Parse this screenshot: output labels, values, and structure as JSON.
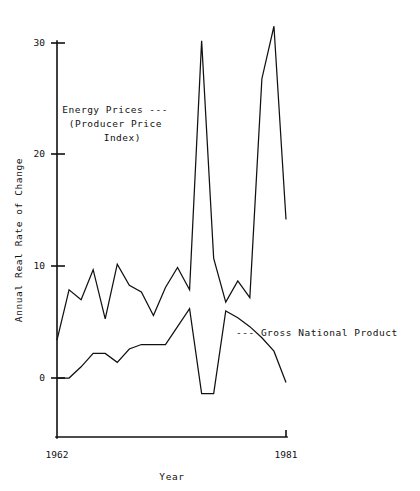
{
  "chart_data": {
    "type": "line",
    "title": "",
    "xlabel": "Year",
    "ylabel": "Annual Real Rate of Change",
    "xlim": [
      1962,
      1981
    ],
    "ylim": [
      -3,
      32
    ],
    "xticks": [
      1962,
      1981
    ],
    "xticklabels": [
      "1962",
      "1981"
    ],
    "yticks": [
      0,
      10,
      20,
      30
    ],
    "yticklabels": [
      "0",
      "10",
      "20",
      "30"
    ],
    "grid": false,
    "legend_position": "inline-annotations",
    "x": [
      1962,
      1963,
      1964,
      1965,
      1966,
      1967,
      1968,
      1969,
      1970,
      1971,
      1972,
      1973,
      1974,
      1975,
      1976,
      1977,
      1978,
      1979,
      1980,
      1981
    ],
    "series": [
      {
        "name": "Energy Prices (Producer Price Index)",
        "values": [
          3.4,
          7.9,
          7.0,
          9.7,
          5.3,
          10.2,
          8.3,
          7.7,
          5.6,
          8.1,
          9.9,
          7.9,
          30.2,
          10.7,
          6.8,
          8.7,
          7.2,
          26.8,
          31.5,
          14.2
        ]
      },
      {
        "name": "Gross National Product",
        "values": [
          0.0,
          0.0,
          1.0,
          2.2,
          2.2,
          1.4,
          2.6,
          3.0,
          3.0,
          3.0,
          4.6,
          6.2,
          -1.4,
          -1.4,
          6.0,
          5.4,
          4.6,
          3.6,
          2.4,
          -0.4
        ]
      }
    ],
    "annotations": [
      {
        "name": "energy-prices-label",
        "lines": [
          "Energy Prices ---",
          "(Producer Price",
          "Index)"
        ],
        "x": 78,
        "y": 110
      },
      {
        "name": "gnp-label",
        "lines": [
          "--- Gross National Product"
        ],
        "x": 236,
        "y": 333
      }
    ]
  },
  "axes": {
    "y_title": "Annual Real Rate of Change",
    "x_title": "Year",
    "y_tick_0": "0",
    "y_tick_10": "10",
    "y_tick_20": "20",
    "y_tick_30": "30",
    "x_tick_start": "1962",
    "x_tick_end": "1981"
  },
  "annotation_text": {
    "energy_line1": "Energy Prices ---",
    "energy_line2": "(Producer Price",
    "energy_line3": "Index)",
    "gnp_line1": "--- Gross National Product"
  },
  "colors": {
    "line": "#111111",
    "axis": "#111111",
    "background": "#ffffff"
  }
}
